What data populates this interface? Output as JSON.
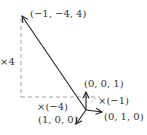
{
  "diagram": {
    "labels": {
      "big_vector": "(−1, −4, 4)",
      "e3": "(0, 0, 1)",
      "e2": "(0, 1, 0)",
      "e1": "(1, 0, 0)",
      "scale_z": "×4",
      "scale_y": "×(−4)",
      "scale_x": "×(−1)"
    },
    "colors": {
      "vector": "#222222",
      "dashed": "#999999",
      "text": "#333333"
    }
  }
}
